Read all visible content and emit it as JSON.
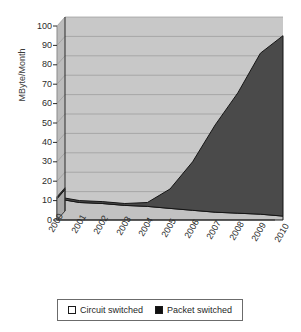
{
  "chart_data": {
    "type": "area",
    "subtype": "stacked-area-3d",
    "title": "",
    "xlabel": "",
    "ylabel": "MByte/Month",
    "ylim": [
      0,
      100
    ],
    "ytick_step": 10,
    "grid": true,
    "legend_position": "bottom",
    "categories": [
      "2000",
      "2001",
      "2002",
      "2003",
      "2004",
      "2005",
      "2006",
      "2007",
      "2008",
      "2009",
      "2010"
    ],
    "yticks": [
      "100",
      "90",
      "80",
      "70",
      "60",
      "50",
      "40",
      "30",
      "20",
      "10",
      "0"
    ],
    "series": [
      {
        "name": "Circuit switched",
        "color": "#c8c8c8",
        "values": [
          11,
          9,
          8.5,
          7.5,
          7,
          6,
          5,
          4,
          3.5,
          3,
          2
        ]
      },
      {
        "name": "Packet switched",
        "color": "#4a4a4a",
        "values": [
          1,
          1,
          1,
          1,
          2,
          10,
          25,
          45,
          62,
          83,
          93
        ]
      }
    ],
    "totals": [
      12,
      10,
      9.5,
      8.5,
      9,
      16,
      30,
      49,
      65.5,
      86,
      95
    ]
  },
  "legend": {
    "entries": [
      {
        "label": "Circuit switched",
        "swatch": "white-square-swatch"
      },
      {
        "label": "Packet switched",
        "swatch": "black-square-swatch"
      }
    ]
  },
  "axes": {
    "y_title": "MByte/Month"
  },
  "colors": {
    "plot_background": "#c8c8c8",
    "wall_left": "#bdbdbd",
    "floor": "#b5b5b5",
    "packet_area": "#4a4a4a",
    "packet_side": "#303030",
    "circuit_area": "#c0c0c0",
    "gridline": "#9a9a9a",
    "axis_line": "#2b2b2b",
    "legend_border": "#6b6b6b"
  }
}
